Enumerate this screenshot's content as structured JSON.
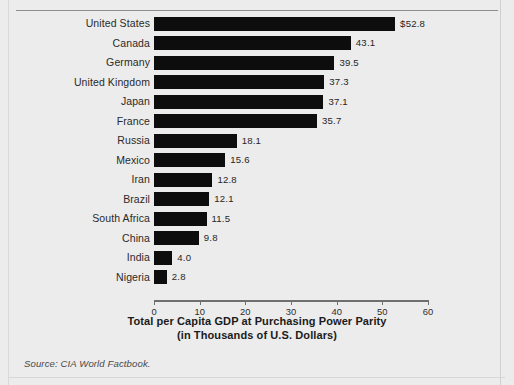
{
  "figure": {
    "source_note": "Source: CIA World Factbook."
  },
  "chart_data": {
    "type": "bar",
    "orientation": "horizontal",
    "title": "",
    "xlabel": "Total per Capita GDP at Purchasing Power Parity (in Thousands of U.S. Dollars)",
    "xlabel_line1": "Total per Capita GDP at Purchasing Power Parity",
    "xlabel_line2": "(in Thousands of U.S. Dollars)",
    "ylabel": "",
    "xlim": [
      0,
      60
    ],
    "xticks": [
      0,
      10,
      20,
      30,
      40,
      50,
      60
    ],
    "xtick_labels": [
      "0",
      "10",
      "20",
      "30",
      "40",
      "50",
      "60"
    ],
    "grid": false,
    "legend": null,
    "bar_color": "#0d0d0d",
    "categories": [
      "United States",
      "Canada",
      "Germany",
      "United Kingdom",
      "Japan",
      "France",
      "Russia",
      "Mexico",
      "Iran",
      "Brazil",
      "South Africa",
      "China",
      "India",
      "Nigeria"
    ],
    "values": [
      52.8,
      43.1,
      39.5,
      37.3,
      37.1,
      35.7,
      18.1,
      15.6,
      12.8,
      12.1,
      11.5,
      9.8,
      4.0,
      2.8
    ],
    "value_labels": [
      "$52.8",
      "43.1",
      "39.5",
      "37.3",
      "37.1",
      "35.7",
      "18.1",
      "15.6",
      "12.8",
      "12.1",
      "11.5",
      "9.8",
      "4.0",
      "2.8"
    ]
  }
}
